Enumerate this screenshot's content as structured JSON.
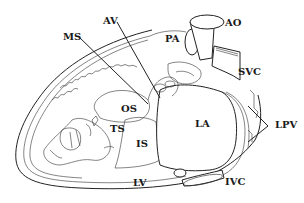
{
  "diagram": {
    "labels": {
      "av": "AV",
      "ms": "MS",
      "ao": "AO",
      "pa": "PA",
      "svc": "SVC",
      "os": "OS",
      "ts": "TS",
      "is": "IS",
      "la": "LA",
      "lpv": "LPV",
      "lv": "LV",
      "ivc": "IVC"
    },
    "colors": {
      "line": "#222222",
      "background": "#ffffff"
    }
  }
}
